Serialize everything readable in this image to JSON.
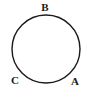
{
  "diagram": {
    "type": "circle-with-labeled-points",
    "circle": {
      "cx": 46,
      "cy": 49,
      "r": 34,
      "stroke": "#1a1a1a"
    },
    "points": [
      {
        "label": "B",
        "x": 45,
        "y": 11
      },
      {
        "label": "C",
        "x": 15,
        "y": 84
      },
      {
        "label": "A",
        "x": 75,
        "y": 85
      }
    ]
  }
}
